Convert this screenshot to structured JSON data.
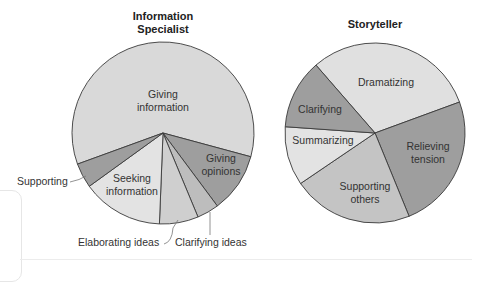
{
  "chart_data": [
    {
      "type": "pie",
      "title": "Information Specialist",
      "labels": [
        "Giving information",
        "Giving opinions",
        "Clarifying ideas",
        "Elaborating ideas",
        "Seeking information",
        "Supporting"
      ],
      "values": [
        59.7,
        10.6,
        3.9,
        6.9,
        14.4,
        4.4
      ],
      "colors": [
        "#d9d9d9",
        "#9e9e9e",
        "#bdbdbd",
        "#cfcfcf",
        "#e3e3e3",
        "#9e9e9e"
      ],
      "label_position": "inside/outside with leader lines",
      "legend": "none"
    },
    {
      "type": "pie",
      "title": "Storyteller",
      "labels": [
        "Dramatizing",
        "Relieving tension",
        "Supporting others",
        "Summarizing",
        "Clarifying"
      ],
      "values": [
        30.8,
        24.4,
        21.7,
        10.6,
        12.5
      ],
      "colors": [
        "#e0e0e0",
        "#9e9e9e",
        "#c4c4c4",
        "#e3e3e3",
        "#9e9e9e"
      ],
      "label_position": "inside",
      "legend": "none"
    }
  ],
  "titles": {
    "left_line1": "Information",
    "left_line2": "Specialist",
    "right": "Storyteller"
  },
  "left_labels": {
    "giving_info_1": "Giving",
    "giving_info_2": "information",
    "giving_opinions_1": "Giving",
    "giving_opinions_2": "opinions",
    "seeking_1": "Seeking",
    "seeking_2": "information",
    "supporting": "Supporting",
    "elaborating": "Elaborating ideas",
    "clarifying": "Clarifying ideas"
  },
  "right_labels": {
    "dramatizing": "Dramatizing",
    "clarifying": "Clarifying",
    "summarizing": "Summarizing",
    "relieving_1": "Relieving",
    "relieving_2": "tension",
    "supporting_1": "Supporting",
    "supporting_2": "others"
  }
}
